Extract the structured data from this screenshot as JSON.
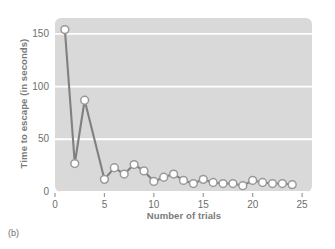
{
  "figure": {
    "panel_letter": "(b)"
  },
  "chart_data": {
    "type": "line",
    "title": "",
    "xlabel": "Number of trials",
    "ylabel": "Time to escape (in seconds)",
    "xlim": [
      0,
      26
    ],
    "ylim": [
      0,
      165
    ],
    "xticks": [
      0,
      5,
      10,
      15,
      20,
      25
    ],
    "xtick_labels": [
      "0",
      "5",
      "10",
      "15",
      "20",
      "25"
    ],
    "yticks": [
      0,
      50,
      100,
      150
    ],
    "ytick_labels": [
      "0",
      "50",
      "100",
      "150"
    ],
    "grid": "horizontal-white",
    "legend": "none",
    "marker": "open-circle",
    "series_color": "#808080",
    "marker_fill": "#ffffff",
    "plot_background": "#d9d9d9",
    "x": [
      1,
      2,
      3,
      5,
      6,
      7,
      8,
      9,
      10,
      11,
      12,
      13,
      14,
      15,
      16,
      17,
      18,
      19,
      20,
      21,
      22,
      23,
      24
    ],
    "values": [
      154,
      27,
      87,
      12,
      23,
      17,
      26,
      20,
      10,
      14,
      17,
      11,
      8,
      12,
      9,
      8,
      8,
      6,
      11,
      9,
      8,
      8,
      7
    ],
    "points": [
      {
        "trial": 1,
        "seconds": 154
      },
      {
        "trial": 2,
        "seconds": 27
      },
      {
        "trial": 3,
        "seconds": 87
      },
      {
        "trial": 5,
        "seconds": 12
      },
      {
        "trial": 6,
        "seconds": 23
      },
      {
        "trial": 7,
        "seconds": 17
      },
      {
        "trial": 8,
        "seconds": 26
      },
      {
        "trial": 9,
        "seconds": 20
      },
      {
        "trial": 10,
        "seconds": 10
      },
      {
        "trial": 11,
        "seconds": 14
      },
      {
        "trial": 12,
        "seconds": 17
      },
      {
        "trial": 13,
        "seconds": 11
      },
      {
        "trial": 14,
        "seconds": 8
      },
      {
        "trial": 15,
        "seconds": 12
      },
      {
        "trial": 16,
        "seconds": 9
      },
      {
        "trial": 17,
        "seconds": 8
      },
      {
        "trial": 18,
        "seconds": 8
      },
      {
        "trial": 19,
        "seconds": 6
      },
      {
        "trial": 20,
        "seconds": 11
      },
      {
        "trial": 21,
        "seconds": 9
      },
      {
        "trial": 22,
        "seconds": 8
      },
      {
        "trial": 23,
        "seconds": 8
      },
      {
        "trial": 24,
        "seconds": 7
      }
    ]
  }
}
